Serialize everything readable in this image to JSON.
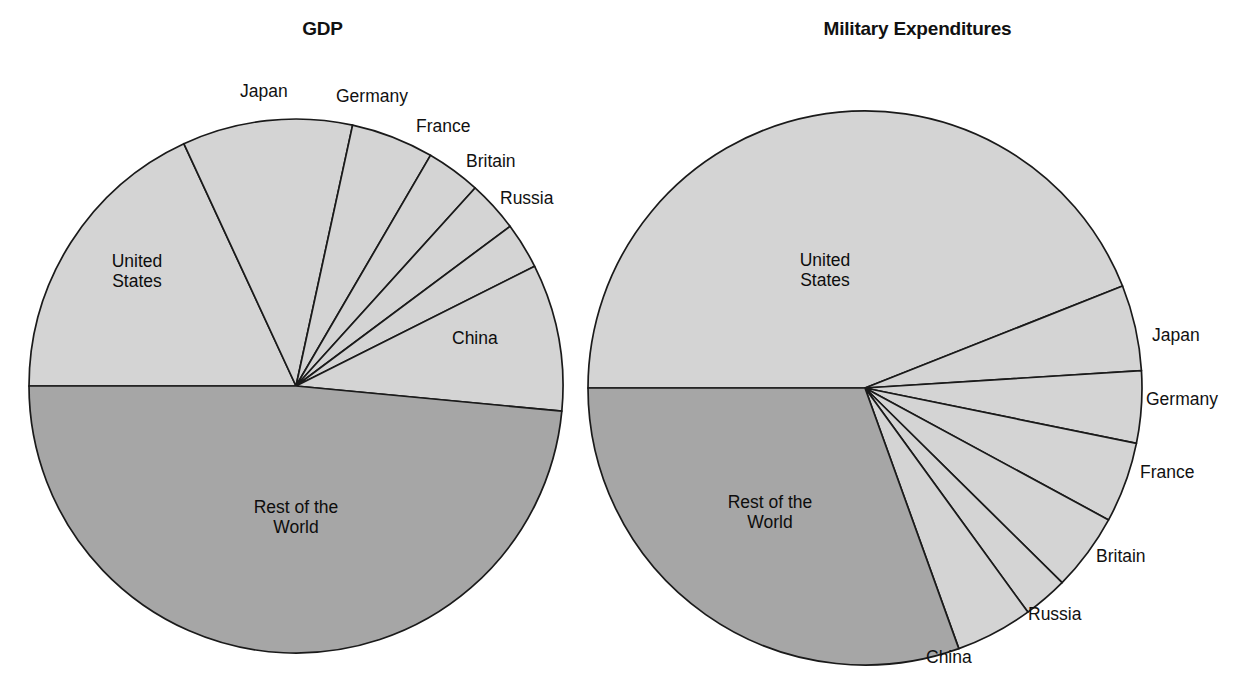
{
  "figure": {
    "background_color": "#ffffff",
    "text_color": "#111111",
    "slice_light_color": "#d4d4d4",
    "slice_dark_color": "#a6a6a6",
    "slice_border_color": "#1a1a1a"
  },
  "charts": [
    {
      "id": "gdp",
      "title": "GDP",
      "center": {
        "x": 296,
        "y": 386
      },
      "radius": 267,
      "labels": {
        "united_states": "United\nStates",
        "japan": "Japan",
        "germany": "Germany",
        "france": "France",
        "britain": "Britain",
        "russia": "Russia",
        "china": "China",
        "rest_of_the_world": "Rest of the\nWorld"
      }
    },
    {
      "id": "military",
      "title": "Military Expenditures",
      "center": {
        "x": 865,
        "y": 388
      },
      "radius": 277,
      "labels": {
        "united_states": "United\nStates",
        "japan": "Japan",
        "germany": "Germany",
        "france": "France",
        "britain": "Britain",
        "russia": "Russia",
        "china": "China",
        "rest_of_the_world": "Rest of the\nWorld"
      }
    }
  ],
  "chart_data": [
    {
      "type": "pie",
      "title": "GDP",
      "id": "gdp",
      "labels": [
        "United States",
        "Japan",
        "Germany",
        "France",
        "Britain",
        "Russia",
        "China",
        "Rest of the World"
      ],
      "values": [
        18.1,
        10.3,
        5.0,
        3.3,
        3.1,
        2.8,
        8.9,
        48.5
      ],
      "units": "percent of world total",
      "start_angle_deg": 180,
      "direction": "clockwise",
      "slice_shades": [
        "light",
        "light",
        "light",
        "light",
        "light",
        "light",
        "light",
        "dark"
      ],
      "label_placement": [
        "inside",
        "outside",
        "outside",
        "outside",
        "outside",
        "outside",
        "inside",
        "inside"
      ],
      "legend": "none",
      "grid": false
    },
    {
      "type": "pie",
      "title": "Military Expenditures",
      "id": "military",
      "labels": [
        "United States",
        "Japan",
        "Germany",
        "France",
        "Britain",
        "Russia",
        "China",
        "Rest of the World"
      ],
      "values": [
        44.0,
        5.0,
        4.2,
        4.7,
        4.5,
        2.6,
        4.5,
        30.5
      ],
      "units": "percent of world total",
      "start_angle_deg": 180,
      "direction": "clockwise",
      "slice_shades": [
        "light",
        "light",
        "light",
        "light",
        "light",
        "light",
        "light",
        "dark"
      ],
      "label_placement": [
        "inside",
        "outside",
        "outside",
        "outside",
        "outside",
        "outside",
        "outside",
        "inside"
      ],
      "legend": "none",
      "grid": false
    }
  ]
}
